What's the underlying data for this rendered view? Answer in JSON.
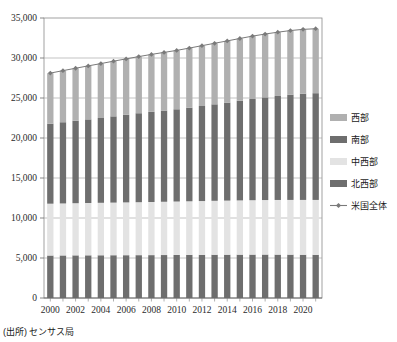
{
  "source_note": "(出所) センサス局",
  "chart_data": {
    "type": "bar",
    "stacked": true,
    "title": "",
    "subtitle": "",
    "xlabel": "",
    "ylabel": "",
    "ylim": [
      0,
      35000
    ],
    "ytick_step": 5000,
    "ytick_labels": [
      "0",
      "5,000",
      "10,000",
      "15,000",
      "20,000",
      "25,000",
      "30,000",
      "35,000"
    ],
    "ytick_values": [
      0,
      5000,
      10000,
      15000,
      20000,
      25000,
      30000,
      35000
    ],
    "grid": true,
    "legend_position": "right",
    "x": [
      2000,
      2001,
      2002,
      2003,
      2004,
      2005,
      2006,
      2007,
      2008,
      2009,
      2010,
      2011,
      2012,
      2013,
      2014,
      2015,
      2016,
      2017,
      2018,
      2019,
      2020,
      2021
    ],
    "xtick_labels": [
      "2000",
      "2002",
      "2004",
      "2006",
      "2008",
      "2010",
      "2012",
      "2014",
      "2016",
      "2018",
      "2020"
    ],
    "xtick_values": [
      2000,
      2002,
      2004,
      2006,
      2008,
      2010,
      2012,
      2014,
      2016,
      2018,
      2020
    ],
    "categories": [
      "2000",
      "2001",
      "2002",
      "2003",
      "2004",
      "2005",
      "2006",
      "2007",
      "2008",
      "2009",
      "2010",
      "2011",
      "2012",
      "2013",
      "2014",
      "2015",
      "2016",
      "2017",
      "2018",
      "2019",
      "2020",
      "2021"
    ],
    "series": [
      {
        "name": "北西部",
        "stack_order": 1,
        "color": "#6e6e6e",
        "values": [
          5310,
          5320,
          5330,
          5335,
          5340,
          5345,
          5350,
          5355,
          5360,
          5370,
          5380,
          5390,
          5400,
          5410,
          5415,
          5420,
          5425,
          5430,
          5425,
          5420,
          5410,
          5400
        ]
      },
      {
        "name": "中西部",
        "stack_order": 2,
        "color": "#e3e3e3",
        "values": [
          6480,
          6500,
          6520,
          6540,
          6560,
          6580,
          6600,
          6620,
          6640,
          6660,
          6680,
          6700,
          6720,
          6740,
          6760,
          6780,
          6800,
          6815,
          6830,
          6840,
          6850,
          6860
        ]
      },
      {
        "name": "南部",
        "stack_order": 3,
        "color": "#6e6e6e",
        "values": [
          10000,
          10150,
          10300,
          10450,
          10600,
          10780,
          10950,
          11120,
          11270,
          11400,
          11530,
          11700,
          11880,
          12060,
          12250,
          12450,
          12650,
          12830,
          13000,
          13160,
          13280,
          13340
        ]
      },
      {
        "name": "西部",
        "stack_order": 4,
        "color": "#b0b0b0",
        "values": [
          6320,
          6450,
          6570,
          6690,
          6800,
          6900,
          6990,
          7080,
          7180,
          7270,
          7360,
          7450,
          7540,
          7630,
          7710,
          7790,
          7860,
          7920,
          7970,
          8010,
          8040,
          8060
        ]
      }
    ],
    "line_series": {
      "name": "米国全体",
      "color": "#7a7a7a",
      "marker": "diamond",
      "values": [
        28110,
        28420,
        28720,
        29015,
        29300,
        29605,
        29890,
        30175,
        30450,
        30700,
        30950,
        31240,
        31540,
        31840,
        32135,
        32440,
        32735,
        32995,
        33225,
        33430,
        33580,
        33660
      ]
    }
  },
  "legend": {
    "items": [
      {
        "label": "西部",
        "type": "swatch",
        "color": "#b0b0b0"
      },
      {
        "label": "南部",
        "type": "swatch",
        "color": "#6e6e6e"
      },
      {
        "label": "中西部",
        "type": "swatch",
        "color": "#e3e3e3"
      },
      {
        "label": "北西部",
        "type": "swatch",
        "color": "#6e6e6e"
      },
      {
        "label": "米国全体",
        "type": "line-marker",
        "color": "#7a7a7a"
      }
    ]
  }
}
